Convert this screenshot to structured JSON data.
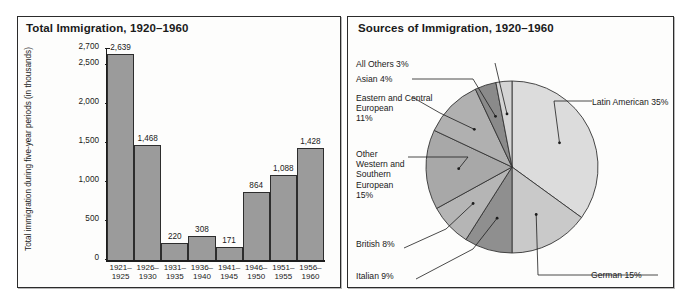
{
  "bar_panel": {
    "title": "Total Immigration, 1920–1960",
    "y_axis_title": "Total immigration during five-year periods (in thousands)"
  },
  "pie_panel": {
    "title": "Sources of Immigration, 1920–1960"
  },
  "chart_data": [
    {
      "type": "bar",
      "title": "Total Immigration, 1920–1960",
      "xlabel": "",
      "ylabel": "Total immigration during five-year periods (in thousands)",
      "ylim": [
        0,
        2700
      ],
      "grid": false,
      "legend": "none",
      "categories": [
        "1921–\n1925",
        "1926–\n1930",
        "1931–\n1935",
        "1936–\n1940",
        "1941–\n1945",
        "1946–\n1950",
        "1951–\n1955",
        "1956–\n1960"
      ],
      "values": [
        2639,
        1468,
        220,
        308,
        171,
        864,
        1088,
        1428
      ],
      "value_labels": [
        "2,639",
        "1,468",
        "220",
        "308",
        "171",
        "864",
        "1,088",
        "1,428"
      ],
      "ytick_values": [
        0,
        500,
        1000,
        1500,
        2000,
        2500,
        2700
      ],
      "ytick_labels": [
        "0",
        "500",
        "1,000",
        "1,500",
        "2,000",
        "2,500",
        "2,700"
      ],
      "bar_color": "#9b9b9b",
      "bar_border_color": "#2d2d2d"
    },
    {
      "type": "pie",
      "title": "Sources of Immigration, 1920–1960",
      "legend": "callout-labels",
      "labels": [
        "Latin American",
        "German",
        "Italian",
        "British",
        "Other Western and Southern European",
        "Eastern and Central European",
        "Asian",
        "All Others"
      ],
      "values": [
        35,
        15,
        9,
        8,
        15,
        11,
        4,
        3
      ],
      "slice_colors": [
        "#dcdcdc",
        "#c9c9c9",
        "#8f8f8f",
        "#b5b5b5",
        "#a8a8a8",
        "#b0b0b0",
        "#8a8a8a",
        "#d4d4d4"
      ],
      "callouts": [
        {
          "id": "latin-american",
          "text": "Latin American 35%"
        },
        {
          "id": "german",
          "text": "German 15%"
        },
        {
          "id": "italian",
          "text": "Italian 9%"
        },
        {
          "id": "british",
          "text": "British 8%"
        },
        {
          "id": "other-western-southern-european",
          "text": "Other\nWestern and\nSouthern\nEuropean\n15%"
        },
        {
          "id": "eastern-central-european",
          "text": "Eastern and Central\nEuropean\n11%"
        },
        {
          "id": "asian",
          "text": "Asian 4%"
        },
        {
          "id": "all-others",
          "text": "All Others 3%"
        }
      ]
    }
  ]
}
